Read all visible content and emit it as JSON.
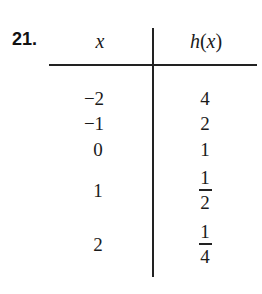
{
  "problem": {
    "number": "21.",
    "table": {
      "headers": {
        "x": "x",
        "hx_func": "h",
        "hx_open": "(",
        "hx_var": "x",
        "hx_close": ")"
      },
      "rows": [
        {
          "x": "−2",
          "hx": "4"
        },
        {
          "x": "−1",
          "hx": "2"
        },
        {
          "x": "0",
          "hx": "1"
        },
        {
          "x": "1",
          "hx_num": "1",
          "hx_den": "2"
        },
        {
          "x": "2",
          "hx_num": "1",
          "hx_den": "4"
        }
      ]
    }
  }
}
